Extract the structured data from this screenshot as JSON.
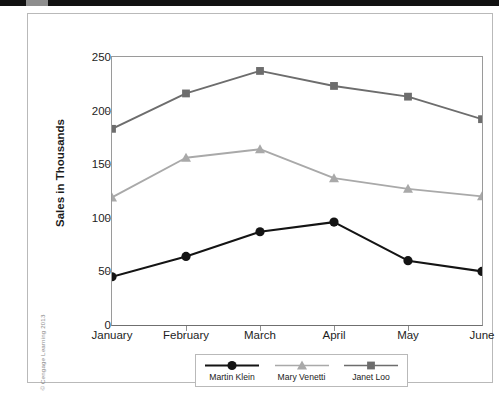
{
  "figure": {
    "copyright": "© Cengage Learning 2013"
  },
  "chart_data": {
    "type": "line",
    "title": "",
    "xlabel": "",
    "ylabel": "Sales in Thousands",
    "categories": [
      "January",
      "February",
      "March",
      "April",
      "May",
      "June"
    ],
    "ylim": [
      0,
      250
    ],
    "yticks": [
      0,
      50,
      100,
      150,
      200,
      250
    ],
    "ytick_labels": [
      "0",
      "50",
      "100",
      "150",
      "200",
      "250"
    ],
    "grid": false,
    "legend_position": "bottom",
    "series": [
      {
        "name": "Martin Klein",
        "values": [
          45,
          64,
          87,
          96,
          60,
          50
        ],
        "color": "#141414",
        "marker": "circle"
      },
      {
        "name": "Mary Venetti",
        "values": [
          119,
          156,
          164,
          137,
          127,
          120
        ],
        "color": "#a9a9a9",
        "marker": "triangle"
      },
      {
        "name": "Janet Loo",
        "values": [
          183,
          216,
          237,
          223,
          213,
          192
        ],
        "color": "#6d6d6d",
        "marker": "square"
      }
    ]
  }
}
